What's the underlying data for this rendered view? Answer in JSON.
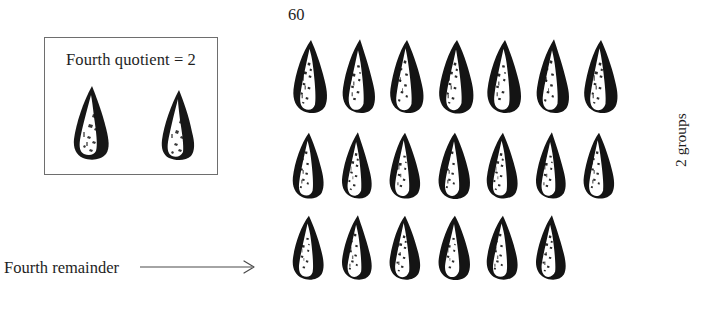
{
  "figure": {
    "type": "division-illustration",
    "total_label": "60",
    "groups_label": "2 groups",
    "quotient_box": {
      "caption": "Fourth quotient = 2",
      "cone_count": 2
    },
    "remainder": {
      "label": "Fourth remainder",
      "arrow": "rightwards-arrow"
    },
    "grid": {
      "rows": [
        {
          "count": 7
        },
        {
          "count": 7
        },
        {
          "count": 6
        }
      ],
      "total_cones": 20
    },
    "colors": {
      "ink": "#1a1a1a",
      "box_border": "#6e6e6e",
      "background": "#ffffff",
      "arrow": "#4a4a4a"
    }
  }
}
